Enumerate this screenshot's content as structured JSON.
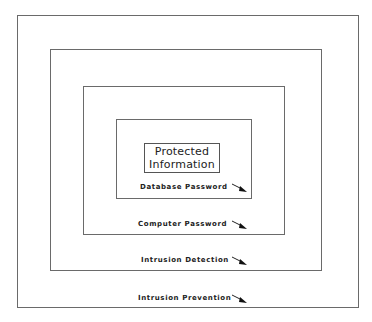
{
  "diagram": {
    "type": "nested-layers",
    "core": {
      "line1": "Protected",
      "line2": "Information"
    },
    "layers": [
      {
        "label": "Database Password",
        "icon": "arrow-down-right-icon"
      },
      {
        "label": "Computer Password",
        "icon": "arrow-down-right-icon"
      },
      {
        "label": "Intrusion Detection",
        "icon": "arrow-down-right-icon"
      },
      {
        "label": "Intrusion Prevention",
        "icon": "arrow-down-right-icon"
      }
    ],
    "colors": {
      "border": "#6a6a6a",
      "text": "#222222",
      "background": "#ffffff"
    }
  }
}
